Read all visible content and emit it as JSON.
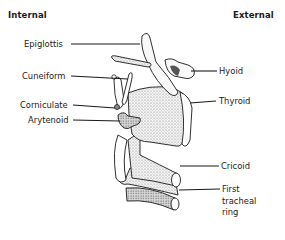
{
  "diagram": {
    "headers": {
      "left": "Internal",
      "right": "External"
    },
    "labels_left": [
      {
        "id": "epiglottis",
        "text": "Epiglottis"
      },
      {
        "id": "cuneiform",
        "text": "Cuneiform"
      },
      {
        "id": "corniculate",
        "text": "Corniculate"
      },
      {
        "id": "arytenoid",
        "text": "Arytenoid"
      }
    ],
    "labels_right": [
      {
        "id": "hyoid",
        "text": "Hyoid"
      },
      {
        "id": "thyroid",
        "text": "Thyroid"
      },
      {
        "id": "cricoid",
        "text": "Cricoid"
      },
      {
        "id": "first-tracheal-ring",
        "text": "First\ntracheal\nring"
      }
    ],
    "colors": {
      "ink": "#1a1a1a",
      "shade": "#8a8a8a",
      "background": "#ffffff"
    }
  }
}
